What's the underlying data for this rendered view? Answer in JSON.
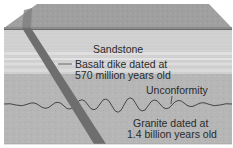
{
  "diagram": {
    "type": "geologic block cross-section",
    "layers": [
      {
        "name": "Sandstone",
        "position": "upper"
      },
      {
        "name": "Granite",
        "position": "lower"
      }
    ],
    "labels": {
      "sandstone": "Sandstone",
      "dike_line1": "Basalt dike dated at",
      "dike_line2": "570 million years old",
      "unconformity": "Unconformity",
      "granite_line1": "Granite dated at",
      "granite_line2": "1.4 billion years old"
    },
    "features": {
      "dike": {
        "name": "Basalt dike",
        "age": "570 million years old"
      },
      "granite": {
        "name": "Granite",
        "age": "1.4 billion years old"
      },
      "unconformity": {
        "name": "Unconformity"
      }
    },
    "colors": {
      "top_face": "#9c9c9c",
      "sandstone": "#d4d4d4",
      "granite": "#b4b4b4",
      "dike": "#6e6e6e",
      "line": "#3a3a3a"
    }
  }
}
